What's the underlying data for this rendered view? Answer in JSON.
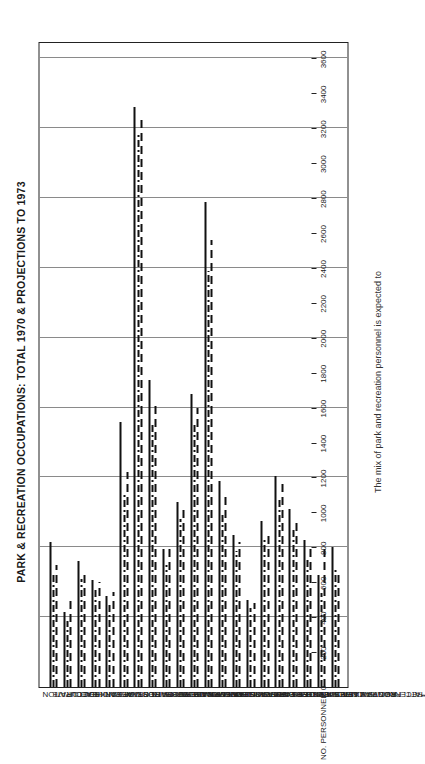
{
  "chart_data": {
    "type": "bar",
    "title": "PARK & RECREATION OCCUPATIONS: TOTAL 1970 & PROJECTIONS TO 1973",
    "caption": "The mix of park and recreation personnel is expected to",
    "xlabel": "NO. PERSONNEL",
    "ylabel": "OCCUPATION",
    "orientation": "horizontal",
    "grid": true,
    "legend_position": "top-center",
    "annotation": "10",
    "xlim": [
      0,
      3600
    ],
    "xticks": [
      0,
      200,
      400,
      600,
      800,
      1000,
      1200,
      1400,
      1600,
      1800,
      2000,
      2200,
      2400,
      2600,
      2800,
      3000,
      3200,
      3400,
      3600
    ],
    "categories": [
      "EXECUTIVE",
      "ASST. DIRECTOR",
      "DIVISION HEAD",
      "SUPT. OF PARKS",
      "SUPT. OF RECREATION",
      "ADM. SUPPORT STAFF",
      "CLERICAL OCCUPATIONS",
      "RELATED PARK PROFESSIONALS",
      "DIST. SUPV. OF PARKS",
      "PARK MANAGERS",
      "PARK RANGERS & POLICE",
      "FOREMEN",
      "*SKILLED PARK PERSONNEL",
      "*SEMI & NON-SKILLED",
      "DIST. SUPV. OF RECREATION",
      "REC. SUPV.",
      "REC. CENTER DIR.",
      "REC. FACILITY MANAGERS",
      "ACTIVITY SPECIALISTS",
      "*REC. PROGRAM LEADERS",
      "*ATTENDANTS & AIDES"
    ],
    "series": [
      {
        "name": "1970 — Actual",
        "style": "solid",
        "values": [
          830,
          430,
          720,
          610,
          520,
          1520,
          3320,
          1760,
          790,
          1060,
          1680,
          2780,
          1180,
          870,
          500,
          950,
          1210,
          1020,
          840,
          640,
          800
        ]
      },
      {
        "name": "1973 — Projected down",
        "style": "dash-dot",
        "values": [
          640,
          380,
          620,
          560,
          470,
          1100,
          3180,
          1520,
          700,
          960,
          1520,
          2380,
          1000,
          780,
          450,
          840,
          1080,
          900,
          740,
          540,
          690
        ]
      },
      {
        "name": "1973 — Projected up",
        "style": "dashed",
        "values": [
          700,
          500,
          660,
          600,
          545,
          1230,
          3260,
          1620,
          820,
          1030,
          1600,
          2560,
          1090,
          830,
          480,
          890,
          1160,
          970,
          800,
          800,
          640
        ]
      }
    ]
  },
  "legend": {
    "items": [
      {
        "label": "1970 — Actual",
        "style": "actual"
      },
      {
        "label": "1973 — Projected down",
        "style": "proj-down"
      },
      {
        "label": "1973 — Projected up",
        "style": "proj-up"
      }
    ]
  }
}
